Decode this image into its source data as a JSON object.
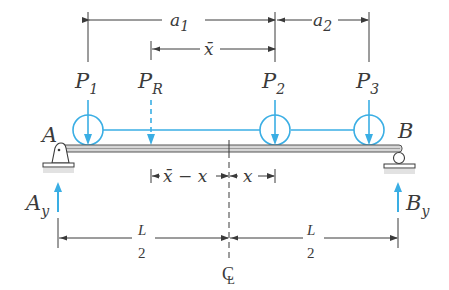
{
  "diagram": {
    "colors": {
      "load": "#3aaee4",
      "line": "#3a3a3a",
      "beam": "#c8c8c8"
    },
    "loads": [
      {
        "label": "P",
        "sub": "1"
      },
      {
        "label": "P",
        "sub": "R",
        "resultant": true
      },
      {
        "label": "P",
        "sub": "2"
      },
      {
        "label": "P",
        "sub": "3"
      }
    ],
    "supports": {
      "left": {
        "label": "A",
        "type": "pin"
      },
      "right": {
        "label": "B",
        "type": "roller"
      }
    },
    "reactions": {
      "left": {
        "label": "A",
        "sub": "y"
      },
      "right": {
        "label": "B",
        "sub": "y"
      }
    },
    "dimensions": {
      "a1": {
        "label": "a",
        "sub": "1"
      },
      "a2": {
        "label": "a",
        "sub": "2"
      },
      "xbar": {
        "label": "x̄"
      },
      "xbar_minus_x": {
        "label": "x̄ − x"
      },
      "x": {
        "label": "x"
      },
      "half_left": {
        "num": "L",
        "den": "2"
      },
      "half_right": {
        "num": "L",
        "den": "2"
      }
    },
    "centerline": {
      "label": "C",
      "label2": "L"
    }
  }
}
